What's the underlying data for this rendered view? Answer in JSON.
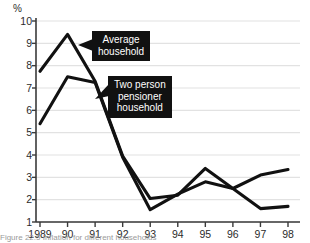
{
  "figure": {
    "axis_unit": "%",
    "caption_partial": "Figure   22.5  Inflation for different households"
  },
  "annotations": [
    {
      "name": "average-household",
      "text": "Average\nhousehold",
      "x": 92,
      "y": 31,
      "arrow_to_x": 78,
      "arrow_to_y": 45
    },
    {
      "name": "two-person-pensioner-household",
      "text": "Two person\npensioner\nhousehold",
      "x": 108,
      "y": 76,
      "arrow_to_x": 95,
      "arrow_to_y": 99
    }
  ],
  "chart_data": {
    "type": "line",
    "title": "",
    "subtitle": "",
    "xlabel": "",
    "ylabel": "%",
    "ylim": [
      1,
      10
    ],
    "xlim": [
      "1989",
      "98"
    ],
    "grid": true,
    "legend": "annotated-callouts",
    "yticks": [
      1,
      2,
      3,
      4,
      5,
      6,
      7,
      8,
      9,
      10
    ],
    "categories": [
      "1989",
      "90",
      "91",
      "92",
      "93",
      "94",
      "95",
      "96",
      "97",
      "98"
    ],
    "series": [
      {
        "name": "Average household",
        "color": "#111111",
        "values": [
          7.75,
          9.4,
          7.3,
          3.95,
          2.05,
          2.2,
          3.4,
          2.5,
          3.1,
          3.35
        ]
      },
      {
        "name": "Two person pensioner household",
        "color": "#111111",
        "values": [
          5.4,
          7.5,
          7.25,
          3.9,
          1.55,
          2.25,
          2.8,
          2.5,
          1.6,
          1.7
        ]
      }
    ]
  }
}
